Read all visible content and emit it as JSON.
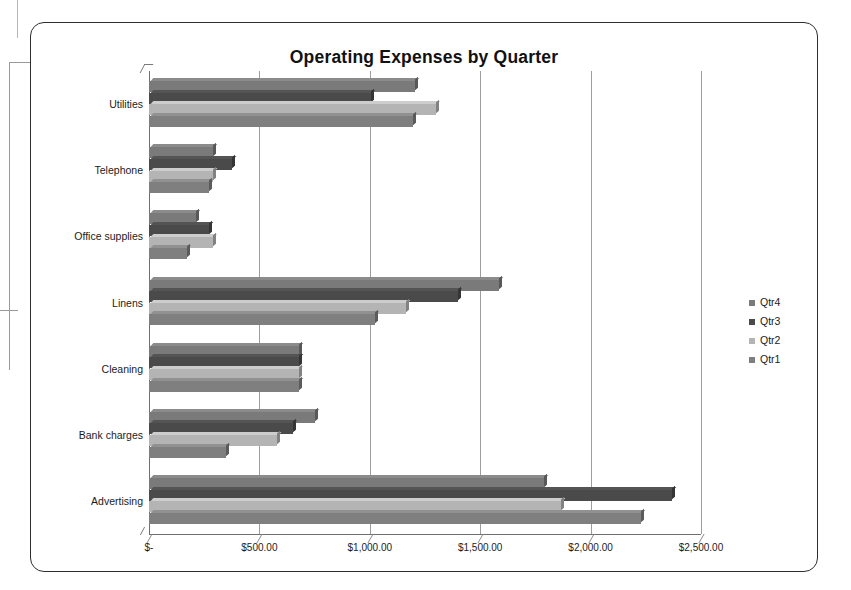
{
  "chart_data": {
    "type": "bar",
    "orientation": "horizontal",
    "title": "Operating Expenses by Quarter",
    "xlabel": "",
    "ylabel": "",
    "xlim": [
      0,
      2500
    ],
    "grid": true,
    "legend_position": "right",
    "categories": [
      "Advertising",
      "Bank charges",
      "Cleaning",
      "Linens",
      "Office supplies",
      "Telephone",
      "Utilities"
    ],
    "tick_labels": [
      "$-",
      "$500.00",
      "$1,000.00",
      "$1,500.00",
      "$2,000.00",
      "$2,500.00"
    ],
    "tick_values": [
      0,
      500,
      1000,
      1500,
      2000,
      2500
    ],
    "series": [
      {
        "name": "Qtr1",
        "color": "#7f7f7f",
        "values": [
          2230,
          350,
          680,
          1025,
          170,
          270,
          1195
        ]
      },
      {
        "name": "Qtr2",
        "color": "#b4b4b4",
        "values": [
          1865,
          580,
          680,
          1165,
          292,
          292,
          1300
        ]
      },
      {
        "name": "Qtr3",
        "color": "#4a4a4a",
        "values": [
          2370,
          650,
          680,
          1400,
          270,
          375,
          1005
        ]
      },
      {
        "name": "Qtr4",
        "color": "#7a7a7a",
        "values": [
          1790,
          750,
          680,
          1585,
          215,
          290,
          1205
        ]
      }
    ],
    "legend_entries": [
      "Qtr4",
      "Qtr3",
      "Qtr2",
      "Qtr1"
    ]
  }
}
